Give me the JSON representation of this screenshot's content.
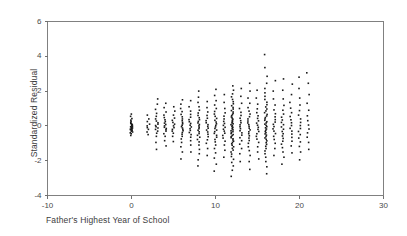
{
  "chart_data": {
    "type": "scatter",
    "title": "",
    "xlabel": "Father's Highest Year of School",
    "ylabel": "Standardized Residual",
    "xlim": [
      -10,
      30
    ],
    "ylim": [
      -4,
      6
    ],
    "xticks": [
      -10,
      0,
      10,
      20,
      30
    ],
    "xticklabels": [
      "-10",
      "0",
      "10",
      "20",
      "30"
    ],
    "yticks": [
      -4,
      -2,
      0,
      2,
      4,
      6
    ],
    "yticklabels": [
      "-4",
      "-2",
      "0",
      "2",
      "4",
      "6"
    ],
    "grid": false,
    "legend": null,
    "marker_color": "#1a1a1a",
    "marker_size_px": 1.6,
    "frame_color": "#808080",
    "columns": [
      {
        "x": 0,
        "values": [
          -0.55,
          -0.45,
          -0.4,
          -0.35,
          -0.3,
          -0.28,
          -0.25,
          -0.22,
          -0.2,
          -0.18,
          -0.15,
          -0.12,
          -0.1,
          -0.08,
          -0.05,
          -0.02,
          0.0,
          0.03,
          0.06,
          0.09,
          0.12,
          0.15,
          0.2,
          0.26,
          0.33,
          0.42,
          0.55,
          0.68
        ]
      },
      {
        "x": 2,
        "values": [
          -0.5,
          -0.35,
          -0.2,
          -0.1,
          0.0,
          0.1,
          0.25,
          0.4,
          0.62
        ]
      },
      {
        "x": 3,
        "values": [
          -1.35,
          -0.95,
          -0.6,
          -0.42,
          -0.3,
          -0.2,
          -0.12,
          -0.05,
          0.02,
          0.1,
          0.18,
          0.28,
          0.4,
          0.55,
          0.72,
          0.95,
          1.25,
          1.55
        ]
      },
      {
        "x": 4,
        "values": [
          -1.15,
          -0.85,
          -0.6,
          -0.45,
          -0.3,
          -0.22,
          -0.15,
          -0.08,
          0.0,
          0.08,
          0.16,
          0.25,
          0.35,
          0.48,
          0.62,
          0.8,
          1.05,
          1.3
        ]
      },
      {
        "x": 5,
        "values": [
          -0.9,
          -0.6,
          -0.42,
          -0.3,
          -0.2,
          -0.1,
          0.0,
          0.1,
          0.2,
          0.32,
          0.45,
          0.62,
          0.85,
          1.1
        ]
      },
      {
        "x": 6,
        "values": [
          -1.9,
          -1.5,
          -1.2,
          -0.95,
          -0.75,
          -0.6,
          -0.48,
          -0.38,
          -0.28,
          -0.2,
          -0.12,
          -0.04,
          0.04,
          0.12,
          0.2,
          0.3,
          0.4,
          0.52,
          0.66,
          0.82,
          1.0,
          1.25,
          1.5
        ]
      },
      {
        "x": 7,
        "values": [
          -1.5,
          -1.1,
          -0.85,
          -0.65,
          -0.5,
          -0.38,
          -0.26,
          -0.16,
          -0.06,
          0.04,
          0.14,
          0.24,
          0.36,
          0.5,
          0.66,
          0.85,
          1.1,
          1.45
        ]
      },
      {
        "x": 8,
        "values": [
          -2.3,
          -1.95,
          -1.6,
          -1.35,
          -1.1,
          -0.92,
          -0.78,
          -0.65,
          -0.54,
          -0.44,
          -0.34,
          -0.25,
          -0.16,
          -0.08,
          0.0,
          0.08,
          0.17,
          0.26,
          0.36,
          0.47,
          0.6,
          0.74,
          0.9,
          1.1,
          1.35,
          1.65,
          2.0
        ]
      },
      {
        "x": 9,
        "values": [
          -1.7,
          -1.3,
          -1.0,
          -0.8,
          -0.62,
          -0.48,
          -0.35,
          -0.24,
          -0.13,
          -0.03,
          0.07,
          0.18,
          0.3,
          0.44,
          0.6,
          0.8,
          1.05,
          1.4
        ]
      },
      {
        "x": 10,
        "values": [
          -2.6,
          -2.2,
          -1.85,
          -1.55,
          -1.3,
          -1.1,
          -0.92,
          -0.78,
          -0.65,
          -0.54,
          -0.43,
          -0.33,
          -0.24,
          -0.15,
          -0.06,
          0.03,
          0.12,
          0.22,
          0.32,
          0.43,
          0.55,
          0.68,
          0.83,
          1.0,
          1.2,
          1.45,
          1.75,
          2.1
        ]
      },
      {
        "x": 11,
        "values": [
          -1.8,
          -1.4,
          -1.1,
          -0.88,
          -0.7,
          -0.55,
          -0.42,
          -0.3,
          -0.19,
          -0.08,
          0.03,
          0.14,
          0.26,
          0.4,
          0.56,
          0.75,
          1.0,
          1.35,
          1.8
        ]
      },
      {
        "x": 12,
        "values": [
          -2.9,
          -2.55,
          -2.3,
          -2.1,
          -1.92,
          -1.76,
          -1.62,
          -1.5,
          -1.39,
          -1.29,
          -1.2,
          -1.11,
          -1.03,
          -0.95,
          -0.88,
          -0.81,
          -0.74,
          -0.68,
          -0.62,
          -0.56,
          -0.5,
          -0.44,
          -0.38,
          -0.33,
          -0.28,
          -0.23,
          -0.18,
          -0.13,
          -0.08,
          -0.03,
          0.02,
          0.07,
          0.12,
          0.17,
          0.22,
          0.27,
          0.33,
          0.39,
          0.45,
          0.51,
          0.58,
          0.65,
          0.72,
          0.8,
          0.88,
          0.97,
          1.06,
          1.16,
          1.27,
          1.39,
          1.52,
          1.67,
          1.84,
          2.05,
          2.3
        ]
      },
      {
        "x": 13,
        "values": [
          -2.05,
          -1.6,
          -1.3,
          -1.05,
          -0.85,
          -0.68,
          -0.53,
          -0.4,
          -0.28,
          -0.16,
          -0.05,
          0.06,
          0.18,
          0.3,
          0.44,
          0.6,
          0.78,
          1.0,
          1.3,
          1.7,
          2.15
        ]
      },
      {
        "x": 14,
        "values": [
          -2.5,
          -2.05,
          -1.7,
          -1.42,
          -1.2,
          -1.0,
          -0.84,
          -0.7,
          -0.57,
          -0.45,
          -0.34,
          -0.23,
          -0.13,
          -0.03,
          0.07,
          0.17,
          0.28,
          0.4,
          0.53,
          0.68,
          0.85,
          1.05,
          1.3,
          1.6,
          2.0,
          2.45
        ]
      },
      {
        "x": 15,
        "values": [
          -1.9,
          -1.5,
          -1.2,
          -0.95,
          -0.76,
          -0.6,
          -0.45,
          -0.32,
          -0.2,
          -0.08,
          0.04,
          0.16,
          0.29,
          0.43,
          0.58,
          0.76,
          0.98,
          1.25,
          1.6,
          2.05
        ]
      },
      {
        "x": 16,
        "values": [
          -2.75,
          -2.35,
          -2.05,
          -1.8,
          -1.6,
          -1.44,
          -1.3,
          -1.17,
          -1.06,
          -0.96,
          -0.86,
          -0.77,
          -0.69,
          -0.61,
          -0.53,
          -0.46,
          -0.39,
          -0.32,
          -0.25,
          -0.18,
          -0.11,
          -0.04,
          0.03,
          0.1,
          0.17,
          0.24,
          0.32,
          0.4,
          0.48,
          0.57,
          0.66,
          0.76,
          0.86,
          0.97,
          1.09,
          1.22,
          1.36,
          1.52,
          1.7,
          1.9,
          2.15,
          2.45,
          2.85,
          3.35,
          4.1
        ]
      },
      {
        "x": 17,
        "values": [
          -1.7,
          -1.3,
          -1.0,
          -0.78,
          -0.6,
          -0.44,
          -0.3,
          -0.17,
          -0.04,
          0.09,
          0.22,
          0.36,
          0.52,
          0.7,
          0.92,
          1.2,
          1.55,
          2.0,
          2.6
        ]
      },
      {
        "x": 18,
        "values": [
          -2.2,
          -1.8,
          -1.5,
          -1.25,
          -1.05,
          -0.88,
          -0.72,
          -0.58,
          -0.45,
          -0.32,
          -0.19,
          -0.06,
          0.07,
          0.2,
          0.34,
          0.5,
          0.68,
          0.9,
          1.18,
          1.55,
          2.05,
          2.7
        ]
      },
      {
        "x": 19,
        "values": [
          -1.55,
          -1.15,
          -0.88,
          -0.66,
          -0.47,
          -0.3,
          -0.14,
          0.02,
          0.18,
          0.35,
          0.54,
          0.76,
          1.02,
          1.35,
          1.8,
          2.4
        ]
      },
      {
        "x": 20,
        "values": [
          -1.95,
          -1.5,
          -1.18,
          -0.92,
          -0.7,
          -0.5,
          -0.32,
          -0.15,
          0.02,
          0.2,
          0.4,
          0.62,
          0.88,
          1.2,
          1.6,
          2.15,
          2.8
        ]
      },
      {
        "x": 21,
        "values": [
          -1.35,
          -0.95,
          -0.65,
          -0.4,
          -0.18,
          0.05,
          0.3,
          0.58,
          0.9,
          1.3,
          1.8,
          2.45,
          3.05
        ]
      }
    ]
  }
}
